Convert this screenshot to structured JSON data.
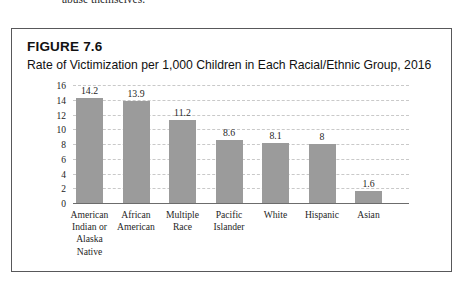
{
  "page": {
    "running_text": "abuse themselves."
  },
  "figure": {
    "number_label": "FIGURE 7.6",
    "title": "Rate of Victimization per 1,000 Children in Each Racial/Ethnic Group, 2016"
  },
  "colors": {
    "bar_fill": "#9b9b9b",
    "gridline": "#c9c9c9",
    "axis_line": "#6c6c6c",
    "box_border": "#58585a",
    "text": "#1f1f1f"
  },
  "chart_data": {
    "type": "bar",
    "title": "Rate of Victimization per 1,000 Children in Each Racial/Ethnic Group, 2016",
    "xlabel": "",
    "ylabel": "",
    "ylim": [
      0,
      16
    ],
    "yticks": [
      0,
      2,
      4,
      6,
      8,
      10,
      12,
      14,
      16
    ],
    "ytick_labels": [
      "0",
      "2",
      "4",
      "6",
      "8",
      "10",
      "12",
      "14",
      "16"
    ],
    "grid": true,
    "legend": false,
    "orientation": "vertical",
    "categories": [
      "American Indian or Alaska Native",
      "African American",
      "Multiple Race",
      "Pacific Islander",
      "White",
      "Hispanic",
      "Asian"
    ],
    "category_lines": [
      [
        "American",
        "Indian or",
        "Alaska",
        "Native"
      ],
      [
        "African",
        "American"
      ],
      [
        "Multiple",
        "Race"
      ],
      [
        "Pacific",
        "Islander"
      ],
      [
        "White"
      ],
      [
        "Hispanic"
      ],
      [
        "Asian"
      ]
    ],
    "values": [
      14.2,
      13.9,
      11.2,
      8.6,
      8.1,
      8,
      1.6
    ],
    "data_labels": [
      "14.2",
      "13.9",
      "11.2",
      "8.6",
      "8.1",
      "8",
      "1.6"
    ]
  }
}
